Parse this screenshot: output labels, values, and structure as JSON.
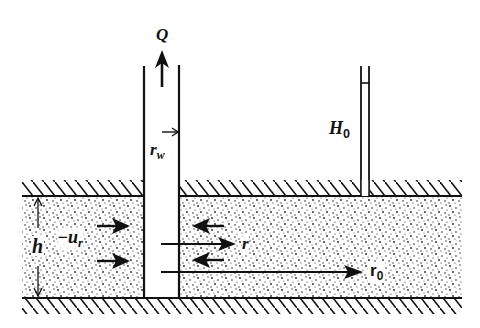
{
  "diagram": {
    "labels": {
      "discharge": "Q",
      "well_radius": "r",
      "well_radius_sub": "w",
      "head": "H",
      "head_sub": "0",
      "thickness": "h",
      "velocity": "−u",
      "velocity_sub": "r",
      "radius": "r",
      "outer_radius": "r",
      "outer_radius_sub": "0"
    },
    "colors": {
      "ink": "#111111",
      "background": "#ffffff"
    }
  }
}
